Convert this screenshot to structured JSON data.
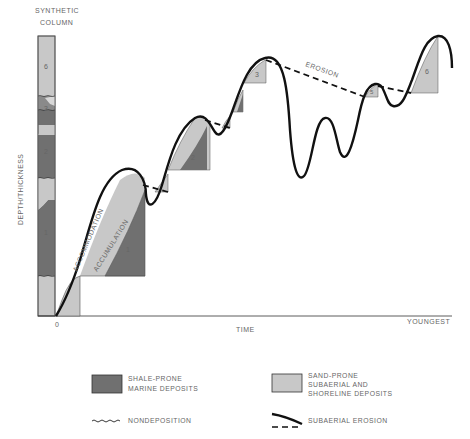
{
  "figure": {
    "column_title_line1": "SYNTHETIC",
    "column_title_line2": "COLUMN",
    "y_axis_label": "DEPTH/THICKNESS",
    "x_axis_label": "TIME",
    "x_origin_label": "0",
    "x_end_label": "YOUNGEST",
    "curve_labels": {
      "accommodation": "ACCOMMODATION",
      "accumulation": "ACCUMULATION",
      "erosion": "EROSION"
    },
    "column_units": [
      {
        "label": "6",
        "type": "sand"
      },
      {
        "label": "3",
        "type": "shale"
      },
      {
        "label": "2",
        "type": "shale"
      },
      {
        "label": "1",
        "type": "shale"
      }
    ],
    "wedge_labels": [
      "1",
      "2",
      "3",
      "5",
      "6"
    ]
  },
  "legend": {
    "shale_line1": "SHALE-PRONE",
    "shale_line2": "MARINE DEPOSITS",
    "sand_line1": "SAND-PRONE",
    "sand_line2": "SUBAERIAL AND",
    "sand_line3": "SHORELINE DEPOSITS",
    "nondeposition": "NONDEPOSITION",
    "subaerial_erosion": "SUBAERIAL EROSION"
  },
  "colors": {
    "shale": "#707070",
    "sand": "#c8c8c8",
    "line": "#111111",
    "text": "#666666"
  }
}
